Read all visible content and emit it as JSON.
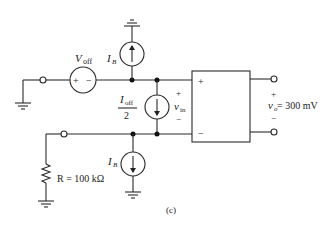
{
  "figure": {
    "caption": "(c)"
  },
  "components": {
    "voltage_source": {
      "label": "V",
      "sub": "off",
      "plus": "+",
      "minus": "−"
    },
    "current_source_top": {
      "label": "I",
      "sub": "B",
      "direction": "up"
    },
    "current_source_mid": {
      "label_num": "I",
      "label_num_sub": "off",
      "label_den": "2",
      "direction": "down"
    },
    "current_source_bottom": {
      "label": "I",
      "sub": "B",
      "direction": "down"
    },
    "resistor": {
      "label": "R = 100 kΩ"
    },
    "amplifier_box": {
      "plus": "+",
      "minus": "−"
    },
    "input_voltage": {
      "label": "v",
      "sub": "in",
      "plus": "+",
      "minus": "−"
    },
    "output_voltage": {
      "label": "v",
      "sub": "o",
      "value": " = 300 mV",
      "plus": "+",
      "minus": "−"
    }
  }
}
